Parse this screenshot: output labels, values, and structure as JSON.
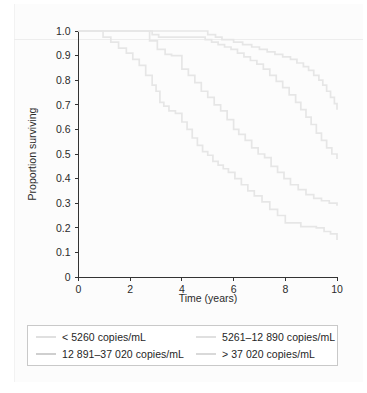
{
  "chart_data": {
    "type": "line",
    "title": "",
    "xlabel": "Time (years)",
    "ylabel": "Proportion surviving",
    "xlim": [
      0,
      10
    ],
    "ylim": [
      0,
      1.0
    ],
    "grid": false,
    "legend_position": "below",
    "x_ticks": [
      "0",
      "2",
      "4",
      "6",
      "8",
      "10"
    ],
    "x_tick_values": [
      0,
      2,
      4,
      6,
      8,
      10
    ],
    "y_ticks": [
      "0",
      "0.1",
      "0.2",
      "0.3",
      "0.4",
      "0.5",
      "0.6",
      "0.7",
      "0.8",
      "0.9",
      "1.0"
    ],
    "y_tick_values": [
      0,
      0.1,
      0.2,
      0.3,
      0.4,
      0.5,
      0.6,
      0.7,
      0.8,
      0.9,
      1.0
    ],
    "curve_style": "step",
    "series": [
      {
        "name": "< 5260 copies/mL",
        "color": "#e6e6e6",
        "final_value": 0.68,
        "x": [
          0.0,
          4.75,
          5.0,
          5.3,
          5.55,
          6.0,
          6.35,
          6.7,
          7.0,
          7.3,
          7.6,
          7.9,
          8.2,
          8.45,
          8.7,
          8.9,
          9.1,
          9.3,
          9.45,
          9.6,
          9.75,
          9.9,
          10.0
        ],
        "y": [
          1.0,
          1.0,
          0.985,
          0.975,
          0.965,
          0.955,
          0.945,
          0.935,
          0.925,
          0.915,
          0.905,
          0.895,
          0.885,
          0.87,
          0.855,
          0.84,
          0.82,
          0.8,
          0.78,
          0.755,
          0.73,
          0.705,
          0.68
        ]
      },
      {
        "name": "5261–12 890 copies/mL",
        "color": "#e6e6e6",
        "final_value": 0.48,
        "x": [
          0.0,
          2.55,
          2.85,
          3.1,
          4.65,
          4.9,
          5.15,
          5.4,
          5.65,
          5.9,
          6.15,
          6.4,
          6.65,
          6.9,
          7.15,
          7.4,
          7.65,
          7.9,
          8.15,
          8.4,
          8.6,
          8.8,
          9.0,
          9.2,
          9.4,
          9.6,
          9.8,
          10.0
        ],
        "y": [
          1.0,
          1.0,
          0.985,
          0.975,
          0.975,
          0.965,
          0.955,
          0.945,
          0.935,
          0.925,
          0.91,
          0.895,
          0.88,
          0.865,
          0.845,
          0.82,
          0.795,
          0.77,
          0.74,
          0.71,
          0.68,
          0.65,
          0.62,
          0.585,
          0.555,
          0.525,
          0.5,
          0.48
        ]
      },
      {
        "name": "12 891–37 020 copies/mL",
        "color": "#e6e6e6",
        "final_value": 0.29,
        "x": [
          0.0,
          2.5,
          2.75,
          3.05,
          3.35,
          3.6,
          4.0,
          4.25,
          4.5,
          4.75,
          5.0,
          5.25,
          5.5,
          5.75,
          6.0,
          6.2,
          6.45,
          6.7,
          6.95,
          7.2,
          7.45,
          7.7,
          7.95,
          8.2,
          8.5,
          8.8,
          9.1,
          9.4,
          9.7,
          10.0
        ],
        "y": [
          1.0,
          1.0,
          0.96,
          0.925,
          0.905,
          0.9,
          0.845,
          0.82,
          0.79,
          0.755,
          0.73,
          0.7,
          0.675,
          0.64,
          0.6,
          0.58,
          0.555,
          0.525,
          0.5,
          0.485,
          0.45,
          0.425,
          0.4,
          0.375,
          0.355,
          0.335,
          0.32,
          0.31,
          0.3,
          0.29
        ]
      },
      {
        "name": "> 37 020 copies/mL",
        "color": "#e6e6e6",
        "final_value": 0.15,
        "x": [
          0.0,
          0.6,
          0.95,
          1.25,
          1.55,
          1.85,
          2.1,
          2.35,
          2.6,
          2.85,
          3.0,
          3.15,
          3.3,
          3.5,
          3.75,
          4.0,
          4.2,
          4.4,
          4.6,
          4.8,
          5.0,
          5.2,
          5.4,
          5.6,
          5.8,
          6.05,
          6.3,
          6.55,
          6.8,
          7.1,
          7.4,
          7.7,
          8.0,
          8.6,
          9.2,
          9.5,
          9.75,
          10.0
        ],
        "y": [
          1.0,
          1.0,
          0.975,
          0.955,
          0.93,
          0.91,
          0.885,
          0.86,
          0.82,
          0.78,
          0.755,
          0.71,
          0.695,
          0.675,
          0.665,
          0.63,
          0.6,
          0.565,
          0.535,
          0.51,
          0.495,
          0.47,
          0.455,
          0.44,
          0.425,
          0.4,
          0.375,
          0.35,
          0.33,
          0.305,
          0.275,
          0.25,
          0.22,
          0.205,
          0.2,
          0.185,
          0.175,
          0.15
        ]
      }
    ]
  },
  "legend": {
    "items": [
      {
        "label": "< 5260 copies/mL",
        "color": "#e0e0e0"
      },
      {
        "label": "5261–12 890 copies/mL",
        "color": "#e0e0e0"
      },
      {
        "label": "12 891–37 020 copies/mL",
        "color": "#cfcfcf"
      },
      {
        "label": "> 37 020 copies/mL",
        "color": "#d9d9d9"
      }
    ]
  }
}
